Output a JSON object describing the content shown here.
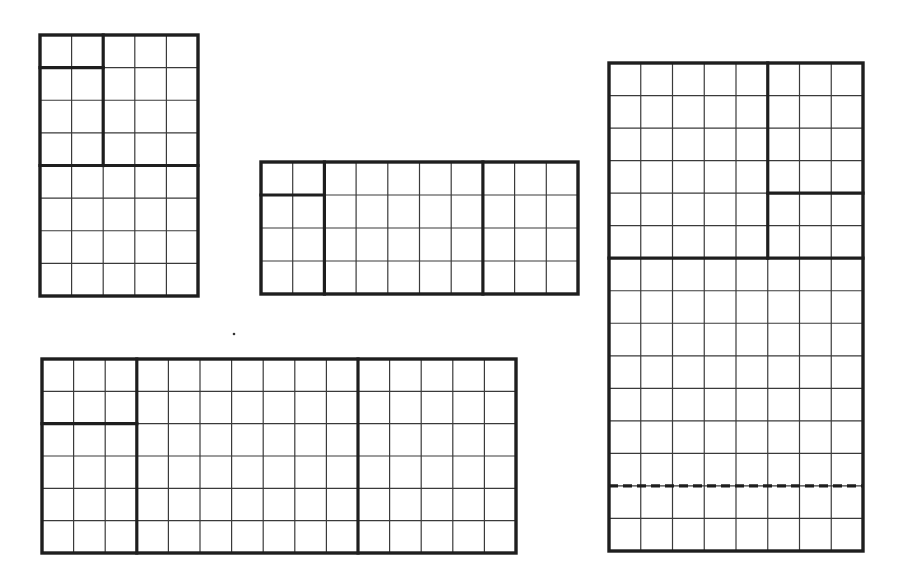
{
  "canvas": {
    "width": 899,
    "height": 583,
    "background": "#ffffff",
    "line_color": "#1e1e1e"
  },
  "grids": [
    {
      "name": "grid-5x8",
      "x": 40,
      "y": 35,
      "width": 158,
      "height": 261,
      "cols": 5,
      "rows": 8,
      "thick_segments": [
        {
          "orient": "v",
          "at": 2,
          "from": 0,
          "to": 4
        },
        {
          "orient": "h",
          "at": 4,
          "from": 0,
          "to": 5
        },
        {
          "orient": "h",
          "at": 1,
          "from": 0,
          "to": 2
        }
      ],
      "dashed_segments": []
    },
    {
      "name": "grid-10x4",
      "x": 261,
      "y": 162,
      "width": 317,
      "height": 132,
      "cols": 10,
      "rows": 4,
      "thick_segments": [
        {
          "orient": "v",
          "at": 2,
          "from": 0,
          "to": 4
        },
        {
          "orient": "v",
          "at": 7,
          "from": 0,
          "to": 4
        },
        {
          "orient": "h",
          "at": 1,
          "from": 0,
          "to": 2
        }
      ],
      "dashed_segments": []
    },
    {
      "name": "grid-15x6",
      "x": 42,
      "y": 359,
      "width": 474,
      "height": 194,
      "cols": 15,
      "rows": 6,
      "thick_segments": [
        {
          "orient": "v",
          "at": 3,
          "from": 0,
          "to": 6
        },
        {
          "orient": "v",
          "at": 10,
          "from": 0,
          "to": 6
        },
        {
          "orient": "h",
          "at": 2,
          "from": 0,
          "to": 3
        }
      ],
      "dashed_segments": []
    },
    {
      "name": "grid-8x15",
      "x": 609,
      "y": 63,
      "width": 254,
      "height": 488,
      "cols": 8,
      "rows": 15,
      "thick_segments": [
        {
          "orient": "v",
          "at": 5,
          "from": 0,
          "to": 6
        },
        {
          "orient": "h",
          "at": 6,
          "from": 0,
          "to": 8
        },
        {
          "orient": "h",
          "at": 4,
          "from": 5,
          "to": 8
        }
      ],
      "dashed_segments": [
        {
          "orient": "h",
          "at": 13,
          "from": 0,
          "to": 8
        }
      ]
    }
  ],
  "decorations": [
    {
      "name": "stray-dot",
      "x": 234,
      "y": 334,
      "r": 1.3
    }
  ]
}
